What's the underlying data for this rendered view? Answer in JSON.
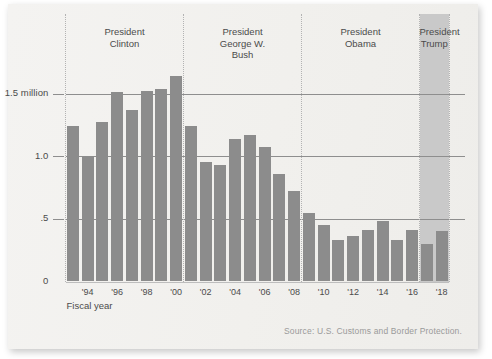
{
  "chart_data": {
    "type": "bar",
    "title": "",
    "xlabel": "Fiscal year",
    "ylabel": "",
    "ylim": [
      0,
      1.75
    ],
    "grid": true,
    "legend_position": "none",
    "source": "Source: U.S. Customs and Border Protection.",
    "categories": [
      "'93",
      "'94",
      "'95",
      "'96",
      "'97",
      "'98",
      "'99",
      "'00",
      "'01",
      "'02",
      "'03",
      "'04",
      "'05",
      "'06",
      "'07",
      "'08",
      "'09",
      "'10",
      "'11",
      "'12",
      "'13",
      "'14",
      "'15",
      "'16",
      "'17",
      "'18"
    ],
    "values": [
      1.24,
      1.0,
      1.27,
      1.51,
      1.37,
      1.52,
      1.54,
      1.64,
      1.24,
      0.95,
      0.93,
      1.14,
      1.17,
      1.07,
      0.86,
      0.72,
      0.55,
      0.45,
      0.33,
      0.36,
      0.41,
      0.48,
      0.33,
      0.41,
      0.3,
      0.4
    ],
    "y_ticks": [
      {
        "value": 0,
        "label": "0"
      },
      {
        "value": 0.5,
        "label": ".5"
      },
      {
        "value": 1.0,
        "label": "1.0"
      },
      {
        "value": 1.5,
        "label": "1.5 million"
      }
    ],
    "x_ticks": [
      "'94",
      "'96",
      "'98",
      "'00",
      "'02",
      "'04",
      "'06",
      "'08",
      "'10",
      "'12",
      "'14",
      "'16",
      "'18"
    ],
    "annotations": [
      {
        "name": "president-clinton",
        "label": "President\nClinton",
        "start": "'93",
        "end": "'00"
      },
      {
        "name": "president-george-w-bush",
        "label": "President\nGeorge W.\nBush",
        "start": "'01",
        "end": "'08"
      },
      {
        "name": "president-obama",
        "label": "President\nObama",
        "start": "'09",
        "end": "'16"
      },
      {
        "name": "president-trump",
        "label": "President\nTrump",
        "start": "'17",
        "end": "'18",
        "shaded": true
      }
    ],
    "colors": {
      "bar": "#8c8c8c",
      "shaded_band": "#c9c9c9",
      "gridline": "#8e8e8e",
      "divider": "#b3b3b3",
      "text": "#4b4b4b",
      "source_text": "#9a9a9a",
      "background": "#f2f1ef"
    }
  }
}
